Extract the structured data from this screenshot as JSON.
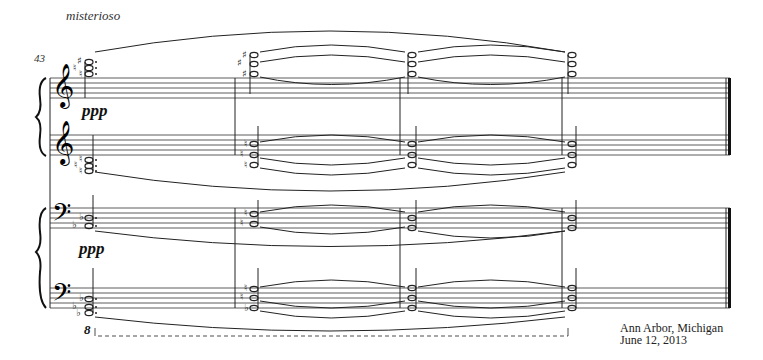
{
  "score": {
    "tempo_marking": "misterioso",
    "measure_number": "43",
    "dynamics": [
      "ppp",
      "ppp"
    ],
    "ottava_marking": "8",
    "systems": [
      {
        "name": "upper-piano",
        "staves": [
          "treble",
          "treble"
        ]
      },
      {
        "name": "lower-piano",
        "staves": [
          "bass",
          "bass"
        ]
      }
    ],
    "barlines_x": [
      235,
      400,
      562
    ],
    "final_barline_x": 728
  },
  "colophon": {
    "place": "Ann Arbor, Michigan",
    "date": "June 12, 2013"
  }
}
